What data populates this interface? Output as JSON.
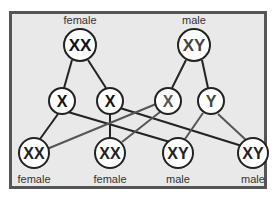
{
  "title_fragment": "offspring genotype diagram",
  "colors": {
    "background": "#e9e9e9",
    "border": "#555555",
    "female_chromosome": "#111111",
    "male_chromosome": "#444444",
    "circle_fill": "#ffffff",
    "circle_stroke": "#222222"
  },
  "parents": [
    {
      "label": "female",
      "genotype": "XX",
      "cx": 80,
      "cy": 45
    },
    {
      "label": "male",
      "genotype": "XY",
      "cx": 194,
      "cy": 45
    }
  ],
  "gametes": [
    {
      "chromosome": "X",
      "from": "female",
      "cx": 62,
      "cy": 101
    },
    {
      "chromosome": "X",
      "from": "female",
      "cx": 110,
      "cy": 101
    },
    {
      "chromosome": "X",
      "from": "male",
      "cx": 168,
      "cy": 101
    },
    {
      "chromosome": "Y",
      "from": "male",
      "cx": 211,
      "cy": 101
    }
  ],
  "offspring": [
    {
      "genotype": "XX",
      "label": "female",
      "cx": 34,
      "cy": 153
    },
    {
      "genotype": "XX",
      "label": "female",
      "cx": 110,
      "cy": 153
    },
    {
      "genotype": "XY",
      "label": "male",
      "cx": 178,
      "cy": 153
    },
    {
      "genotype": "XY",
      "label": "male",
      "cx": 253,
      "cy": 153
    }
  ]
}
